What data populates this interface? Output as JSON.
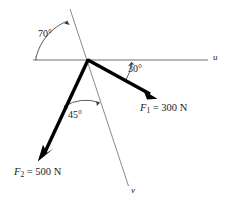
{
  "figure": {
    "type": "force-vector-diagram",
    "background_color": "#ffffff",
    "axes": [
      {
        "name": "u-axis",
        "label": "u",
        "label_x": 213,
        "label_y": 53,
        "color": "#6e6e6e"
      },
      {
        "name": "v-axis",
        "label": "v",
        "label_x": 131,
        "label_y": 186,
        "color": "#8a8a8a"
      }
    ],
    "angles": [
      {
        "name": "angle-70",
        "label": "70°",
        "label_x": 38,
        "label_y": 29,
        "value": 70,
        "between": "u-axis-left and v-axis-upper"
      },
      {
        "name": "angle-30",
        "label": "30°",
        "label_x": 128,
        "label_y": 64,
        "value": 30,
        "between": "u-axis-right and F1"
      },
      {
        "name": "angle-45",
        "label": "45°",
        "label_x": 68,
        "label_y": 110,
        "value": 45,
        "between": "F2 and v-axis-lower"
      }
    ],
    "forces": [
      {
        "name": "force-F1",
        "symbol": "F",
        "subscript": "1",
        "equals": "=",
        "magnitude": "300",
        "unit": "N",
        "label_text": "F1 = 300 N",
        "label_x": 140,
        "label_y": 103,
        "color": "#000000"
      },
      {
        "name": "force-F2",
        "symbol": "F",
        "subscript": "2",
        "equals": "=",
        "magnitude": "500",
        "unit": "N",
        "label_text": "F2 = 500 N",
        "label_x": 14,
        "label_y": 167,
        "color": "#000000"
      }
    ],
    "caption": ""
  }
}
